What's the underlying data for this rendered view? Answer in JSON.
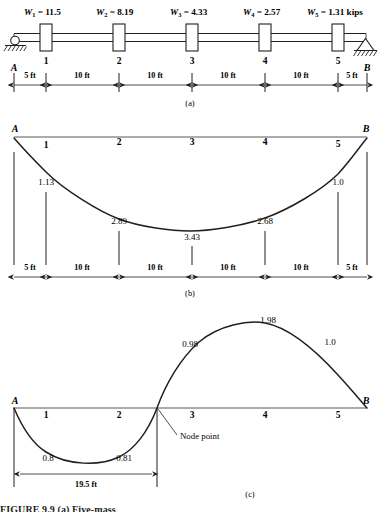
{
  "figure": {
    "title_caption": "FIGURE 9.9  (a) Five-mass",
    "panels": [
      {
        "id": "a",
        "label": "(a)"
      },
      {
        "id": "b",
        "label": "(b)"
      },
      {
        "id": "c",
        "label": "(c)"
      }
    ]
  },
  "panel_a": {
    "label": "(a)",
    "support_left_label": "A",
    "support_right_label": "B",
    "support_left_type": "roller",
    "support_right_type": "pin",
    "units": "kips",
    "loads": [
      {
        "station": "1",
        "symbol": "W",
        "subscript": "1",
        "eq": "=",
        "value": "11.5",
        "text": "W₁ = 11.5"
      },
      {
        "station": "2",
        "symbol": "W",
        "subscript": "2",
        "eq": "=",
        "value": "8.19",
        "text": "W₂ = 8.19"
      },
      {
        "station": "3",
        "symbol": "W",
        "subscript": "3",
        "eq": "=",
        "value": "4.33",
        "text": "W₃ = 4.33"
      },
      {
        "station": "4",
        "symbol": "W",
        "subscript": "4",
        "eq": "=",
        "value": "2.57",
        "text": "W₄ = 2.57"
      },
      {
        "station": "5",
        "symbol": "W",
        "subscript": "5",
        "eq": "=",
        "value": "1.31",
        "text": "W₅ = 1.31 kips"
      }
    ],
    "station_numbers": [
      "1",
      "2",
      "3",
      "4",
      "5"
    ],
    "dimensions": [
      "5 ft",
      "10 ft",
      "10 ft",
      "10 ft",
      "10 ft",
      "5 ft"
    ]
  },
  "panel_b": {
    "label": "(b)",
    "end_left_label": "A",
    "end_right_label": "B",
    "station_numbers": [
      "1",
      "2",
      "3",
      "4",
      "5"
    ],
    "deflections": [
      "1.13",
      "2.89",
      "3.43",
      "2.68",
      "1.0"
    ],
    "dimensions": [
      "5 ft",
      "10 ft",
      "10 ft",
      "10 ft",
      "10 ft",
      "5 ft"
    ]
  },
  "panel_c": {
    "label": "(c)",
    "end_left_label": "A",
    "end_right_label": "B",
    "station_numbers": [
      "1",
      "2",
      "3",
      "4",
      "5"
    ],
    "deflections_below": [
      "0.8",
      "0.81"
    ],
    "deflections_above": [
      "0.98",
      "1.98",
      "1.0"
    ],
    "node_annotation": "Node point",
    "node_dimension": "19.5 ft"
  },
  "chart_data": {
    "type": "line",
    "panels": [
      {
        "id": "a",
        "caption": "(a)",
        "type": "schematic",
        "description": "Simply supported beam with five lumped masses",
        "xlabel": "Span stations",
        "ylabel": "",
        "x_ft": [
          0,
          5,
          15,
          25,
          35,
          45,
          50
        ],
        "station_labels": [
          "A",
          "1",
          "2",
          "3",
          "4",
          "5",
          "B"
        ],
        "weights_kips": [
          11.5,
          8.19,
          4.33,
          2.57,
          1.31
        ],
        "weight_labels": [
          "W1 = 11.5",
          "W2 = 8.19",
          "W3 = 4.33",
          "W4 = 2.57",
          "W5 = 1.31 kips"
        ],
        "segment_lengths_ft": [
          5,
          10,
          10,
          10,
          10,
          5
        ],
        "segment_labels": [
          "5 ft",
          "10 ft",
          "10 ft",
          "10 ft",
          "10 ft",
          "5 ft"
        ],
        "total_span_ft": 50,
        "support_left": "roller",
        "support_right": "pin"
      },
      {
        "id": "b",
        "caption": "(b)",
        "type": "line",
        "description": "First mode shape, all deflections downward",
        "x_ft": [
          0,
          5,
          15,
          25,
          35,
          45,
          50
        ],
        "station_labels": [
          "A",
          "1",
          "2",
          "3",
          "4",
          "5",
          "B"
        ],
        "values": [
          0,
          1.13,
          2.89,
          3.43,
          2.68,
          1.0,
          0
        ],
        "value_labels": [
          "",
          "1.13",
          "2.89",
          "3.43",
          "2.68",
          "1.0",
          ""
        ],
        "sign": "all-negative-downward",
        "segment_labels": [
          "5 ft",
          "10 ft",
          "10 ft",
          "10 ft",
          "10 ft",
          "5 ft"
        ],
        "grid": false,
        "legend": "none"
      },
      {
        "id": "c",
        "caption": "(c)",
        "type": "line",
        "description": "Second mode shape with a node point at 19.5 ft from A",
        "x_ft": [
          0,
          5,
          15,
          19.5,
          25,
          35,
          45,
          50
        ],
        "station_labels": [
          "A",
          "1",
          "2",
          "node",
          "3",
          "4",
          "5",
          "B"
        ],
        "values": [
          0,
          -0.8,
          -0.81,
          0,
          0.98,
          1.98,
          1.0,
          0
        ],
        "value_labels": [
          "",
          "0.8",
          "0.81",
          "",
          "0.98",
          "1.98",
          "1.0",
          ""
        ],
        "node_point_ft": 19.5,
        "node_label": "Node point",
        "node_dimension_label": "19.5 ft",
        "grid": false,
        "legend": "none"
      }
    ]
  }
}
